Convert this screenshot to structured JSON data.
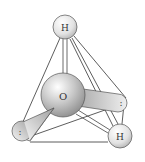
{
  "diagram": {
    "type": "molecular-geometry",
    "atoms": [
      {
        "id": "oxygen",
        "label": "O",
        "cx": 63,
        "cy": 95,
        "r": 22
      },
      {
        "id": "hydrogen-top",
        "label": "H",
        "cx": 65,
        "cy": 27,
        "r": 12
      },
      {
        "id": "hydrogen-bottom-right",
        "label": "H",
        "cx": 120,
        "cy": 136,
        "r": 12
      }
    ],
    "lone_pairs": [
      {
        "id": "lone-pair-left",
        "label": ":",
        "tip_x": 17,
        "tip_y": 130
      },
      {
        "id": "lone-pair-right",
        "label": ":",
        "tip_x": 124,
        "tip_y": 103
      }
    ],
    "colors": {
      "background": "#ffffff",
      "line": "#333333",
      "atom_light": "#f4f4f4",
      "atom_dark": "#9a9a9a",
      "lobe_light": "#f0f0f0",
      "lobe_dark": "#a8a8a8"
    }
  }
}
